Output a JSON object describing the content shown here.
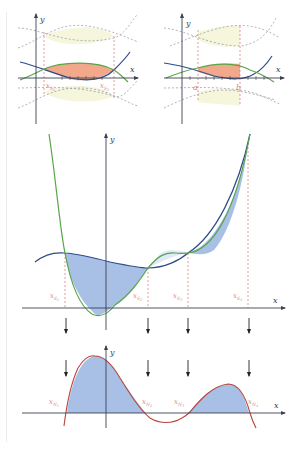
{
  "colors": {
    "axis": "#3c4150",
    "blue_curve": "#2e4c8a",
    "green_curve": "#58a64a",
    "red_curve": "#b8463c",
    "fill_blue": "#a8bfe6",
    "fill_orange": "#f2a88a",
    "fill_yellow": "#f5f6dc",
    "dashed_red": "#d9706a",
    "dashed_gray": "#8f93a3",
    "label_red": "#d98a84",
    "arrow": "#222222"
  },
  "panels": {
    "top_left": {
      "x_axis_label": "x",
      "y_axis_label": "y",
      "points": [
        {
          "label": "x",
          "subscript": "S",
          "subsub": "1"
        },
        {
          "label": "x",
          "subscript": "S",
          "subsub": "2"
        }
      ]
    },
    "top_right": {
      "x_axis_label": "x",
      "y_axis_label": "y",
      "points": [
        {
          "label": "a"
        },
        {
          "label": "b"
        }
      ]
    },
    "middle": {
      "x_axis_label": "x",
      "y_axis_label": "y",
      "points": [
        {
          "label": "x",
          "subscript": "S",
          "subsub": "1"
        },
        {
          "label": "x",
          "subscript": "S",
          "subsub": "2"
        },
        {
          "label": "x",
          "subscript": "S",
          "subsub": "3"
        },
        {
          "label": "x",
          "subscript": "S",
          "subsub": "4"
        }
      ]
    },
    "bottom": {
      "x_axis_label": "x",
      "y_axis_label": "y",
      "points": [
        {
          "label": "x",
          "subscript": "N",
          "subsub": "1"
        },
        {
          "label": "x",
          "subscript": "N",
          "subsub": "2"
        },
        {
          "label": "x",
          "subscript": "N",
          "subsub": "3"
        },
        {
          "label": "x",
          "subscript": "N",
          "subsub": "4"
        }
      ]
    }
  }
}
